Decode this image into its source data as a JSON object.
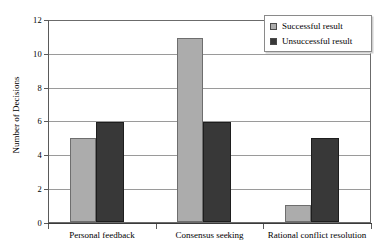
{
  "chart_data": {
    "type": "bar",
    "title": "",
    "subtitle": "",
    "xlabel": "",
    "ylabel": "Number of Decisions",
    "ylim": [
      0,
      12
    ],
    "ytick_step": 2,
    "yticks": [
      "12",
      "10",
      "8",
      "6",
      "4",
      "2",
      "0"
    ],
    "ytick_values": [
      12,
      10,
      8,
      6,
      4,
      2,
      0
    ],
    "grid": true,
    "grid_axis": "y",
    "legend_position": "top-right",
    "categories": [
      "Personal feedback",
      "Consensus seeking",
      "Rational conflict resolution"
    ],
    "series": [
      {
        "name": "Successful result",
        "color": "#acacac",
        "values": [
          5,
          11,
          1
        ]
      },
      {
        "name": "Unsuccessful result",
        "color": "#383838",
        "values": [
          6,
          6,
          5
        ]
      }
    ],
    "annotations": []
  },
  "legend": {
    "items": [
      {
        "label": "Successful result",
        "swatch": "successful-swatch"
      },
      {
        "label": "Unsuccessful result",
        "swatch": "unsuccessful-swatch"
      }
    ]
  },
  "axes": {
    "y_title": "Number of Decisions",
    "y_tick_labels": [
      "12",
      "10",
      "8",
      "6",
      "4",
      "2",
      "0"
    ],
    "x_tick_labels": [
      "Personal feedback",
      "Consensus seeking",
      "Rational conflict resolution"
    ]
  },
  "colors": {
    "successful": "#acacac",
    "unsuccessful": "#383838",
    "gridline": "#9a9a9a",
    "axis": "#5a5a5a",
    "background": "#ffffff"
  }
}
